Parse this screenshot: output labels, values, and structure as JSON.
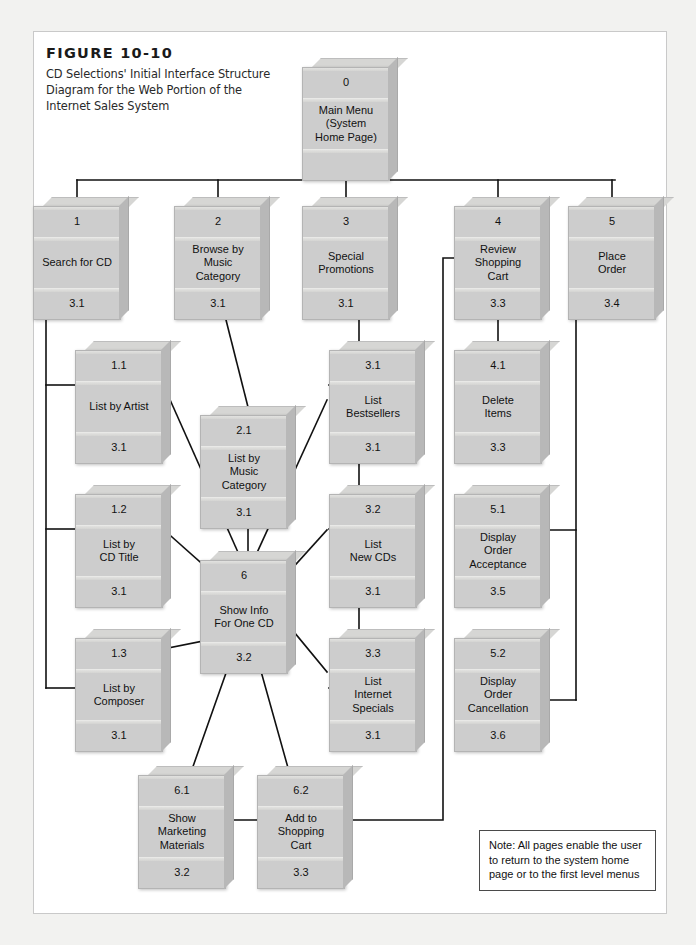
{
  "figure": {
    "number": "FIGURE 10-10",
    "caption": "CD Selections' Initial Interface Structure Diagram for the Web Portion of the Internet Sales System"
  },
  "note": {
    "text": "Note: All pages enable the user to return to the system home page or to the first level menus"
  },
  "colors": {
    "box_face": "#cdcdcd",
    "box_top": "#d6d6d4",
    "box_side": "#b8b8b8",
    "line": "#111111",
    "sheet": "#ffffff",
    "page": "#f2f2f0"
  },
  "boxes": [
    {
      "id": "b0",
      "number": "0",
      "label": "Main Menu\n(System\nHome Page)",
      "ref": "",
      "x": 302,
      "y": 58,
      "label_lines": [
        "Main Menu",
        "(System",
        "Home Page)"
      ]
    },
    {
      "id": "b1",
      "number": "1",
      "label": "Search for CD",
      "ref": "3.1",
      "x": 33,
      "y": 197,
      "label_lines": [
        "Search for CD"
      ]
    },
    {
      "id": "b2",
      "number": "2",
      "label": "Browse by Music Category",
      "ref": "3.1",
      "x": 174,
      "y": 197,
      "label_lines": [
        "Browse by",
        "Music",
        "Category"
      ]
    },
    {
      "id": "b3",
      "number": "3",
      "label": "Special Promotions",
      "ref": "3.1",
      "x": 302,
      "y": 197,
      "label_lines": [
        "Special",
        "Promotions"
      ]
    },
    {
      "id": "b4",
      "number": "4",
      "label": "Review Shopping Cart",
      "ref": "3.3",
      "x": 454,
      "y": 197,
      "label_lines": [
        "Review",
        "Shopping",
        "Cart"
      ]
    },
    {
      "id": "b5",
      "number": "5",
      "label": "Place Order",
      "ref": "3.4",
      "x": 568,
      "y": 197,
      "label_lines": [
        "Place",
        "Order"
      ]
    },
    {
      "id": "b11",
      "number": "1.1",
      "label": "List by Artist",
      "ref": "3.1",
      "x": 75,
      "y": 341,
      "label_lines": [
        "List by Artist"
      ]
    },
    {
      "id": "b12",
      "number": "1.2",
      "label": "List by CD Title",
      "ref": "3.1",
      "x": 75,
      "y": 485,
      "label_lines": [
        "List by",
        "CD Title"
      ]
    },
    {
      "id": "b13",
      "number": "1.3",
      "label": "List by Composer",
      "ref": "3.1",
      "x": 75,
      "y": 629,
      "label_lines": [
        "List by",
        "Composer"
      ]
    },
    {
      "id": "b21",
      "number": "2.1",
      "label": "List by Music Category",
      "ref": "3.1",
      "x": 200,
      "y": 406,
      "label_lines": [
        "List by",
        "Music",
        "Category"
      ]
    },
    {
      "id": "b6",
      "number": "6",
      "label": "Show Info For One CD",
      "ref": "3.2",
      "x": 200,
      "y": 551,
      "label_lines": [
        "Show Info",
        "For One CD"
      ]
    },
    {
      "id": "b31",
      "number": "3.1",
      "label": "List Bestsellers",
      "ref": "3.1",
      "x": 329,
      "y": 341,
      "label_lines": [
        "List",
        "Bestsellers"
      ]
    },
    {
      "id": "b32",
      "number": "3.2",
      "label": "List New CDs",
      "ref": "3.1",
      "x": 329,
      "y": 485,
      "label_lines": [
        "List",
        "New CDs"
      ]
    },
    {
      "id": "b33",
      "number": "3.3",
      "label": "List Internet Specials",
      "ref": "3.1",
      "x": 329,
      "y": 629,
      "label_lines": [
        "List",
        "Internet",
        "Specials"
      ]
    },
    {
      "id": "b41",
      "number": "4.1",
      "label": "Delete Items",
      "ref": "3.3",
      "x": 454,
      "y": 341,
      "label_lines": [
        "Delete",
        "Items"
      ]
    },
    {
      "id": "b51",
      "number": "5.1",
      "label": "Display Order Acceptance",
      "ref": "3.5",
      "x": 454,
      "y": 485,
      "label_lines": [
        "Display",
        "Order",
        "Acceptance"
      ]
    },
    {
      "id": "b52",
      "number": "5.2",
      "label": "Display Order Cancellation",
      "ref": "3.6",
      "x": 454,
      "y": 629,
      "label_lines": [
        "Display",
        "Order",
        "Cancellation"
      ]
    },
    {
      "id": "b61",
      "number": "6.1",
      "label": "Show Marketing Materials",
      "ref": "3.2",
      "x": 138,
      "y": 766,
      "label_lines": [
        "Show",
        "Marketing",
        "Materials"
      ]
    },
    {
      "id": "b62",
      "number": "6.2",
      "label": "Add to Shopping Cart",
      "ref": "3.3",
      "x": 257,
      "y": 766,
      "label_lines": [
        "Add to",
        "Shopping",
        "Cart"
      ]
    }
  ],
  "connections": [
    {
      "from": "0",
      "to": "1"
    },
    {
      "from": "0",
      "to": "2"
    },
    {
      "from": "0",
      "to": "3"
    },
    {
      "from": "0",
      "to": "4"
    },
    {
      "from": "0",
      "to": "5"
    },
    {
      "from": "1",
      "to": "1.1"
    },
    {
      "from": "1",
      "to": "1.2"
    },
    {
      "from": "1",
      "to": "1.3"
    },
    {
      "from": "2",
      "to": "2.1"
    },
    {
      "from": "2.1",
      "to": "6"
    },
    {
      "from": "1.1",
      "to": "6"
    },
    {
      "from": "1.2",
      "to": "6"
    },
    {
      "from": "1.3",
      "to": "6"
    },
    {
      "from": "3",
      "to": "3.1"
    },
    {
      "from": "3",
      "to": "3.2"
    },
    {
      "from": "3",
      "to": "3.3"
    },
    {
      "from": "3.1",
      "to": "6"
    },
    {
      "from": "3.2",
      "to": "6"
    },
    {
      "from": "3.3",
      "to": "6"
    },
    {
      "from": "6",
      "to": "6.1"
    },
    {
      "from": "6",
      "to": "6.2"
    },
    {
      "from": "6.1",
      "to": "6.2"
    },
    {
      "from": "6.2",
      "to": "4"
    },
    {
      "from": "4",
      "to": "4.1"
    },
    {
      "from": "5",
      "to": "5.1"
    },
    {
      "from": "5",
      "to": "5.2"
    }
  ]
}
